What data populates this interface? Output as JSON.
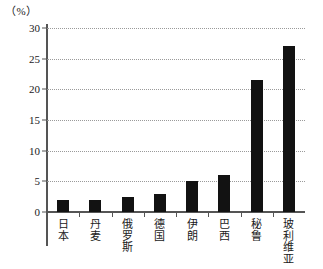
{
  "chart_data": {
    "type": "bar",
    "title": "",
    "subtitle": "",
    "xlabel": "",
    "ylabel": "（%）",
    "unit_label": "（%）",
    "categories": [
      "日本",
      "丹麦",
      "俄罗斯",
      "德国",
      "伊朗",
      "巴西",
      "秘鲁",
      "玻利维亚"
    ],
    "values": [
      2,
      2,
      2.5,
      3,
      5,
      6,
      21.5,
      27
    ],
    "ylim": [
      0,
      30
    ],
    "ytick_labels": [
      "0",
      "5",
      "10",
      "15",
      "20",
      "25",
      "30"
    ],
    "ytick_values": [
      0,
      5,
      10,
      15,
      20,
      25,
      30
    ],
    "grid": true,
    "grid_style": "dotted-horizontal",
    "legend": null,
    "bar_color": "#121212",
    "axis_color": "#555555",
    "grid_color": "#9a9a9a",
    "background": "#ffffff"
  }
}
